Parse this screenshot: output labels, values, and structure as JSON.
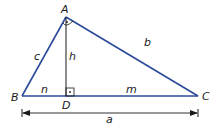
{
  "diagram": {
    "type": "right-triangle-with-altitude",
    "colors": {
      "triangle_stroke": "#2b4a9a",
      "altitude_stroke": "#1a1a1a",
      "text": "#1a1a1a"
    },
    "vertices": {
      "A": {
        "label": "A",
        "x": 66,
        "y": 17
      },
      "B": {
        "label": "B",
        "x": 22,
        "y": 96
      },
      "C": {
        "label": "C",
        "x": 198,
        "y": 96
      },
      "D": {
        "label": "D",
        "x": 66,
        "y": 96
      }
    },
    "sides": {
      "c": {
        "label": "c"
      },
      "b": {
        "label": "b"
      },
      "h": {
        "label": "h"
      },
      "n": {
        "label": "n"
      },
      "m": {
        "label": "m"
      },
      "a": {
        "label": "a"
      }
    },
    "right_angles": [
      "A",
      "D"
    ]
  }
}
